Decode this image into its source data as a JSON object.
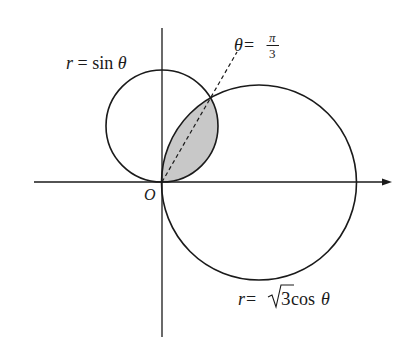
{
  "figure": {
    "colors": {
      "stroke": "#1a1a1a",
      "shade": "#c8c8c8",
      "background": "#ffffff"
    },
    "origin_label": "O",
    "curves": [
      {
        "id": "sin",
        "label_lhs": "r",
        "label_eq": " = ",
        "label_rhs_fn": "sin",
        "label_rhs_var": " θ"
      },
      {
        "id": "cos",
        "label_lhs": "r",
        "label_eq": " = ",
        "label_sqrt_radicand": "3",
        "label_rhs_fn": " cos",
        "label_rhs_var": " θ"
      }
    ],
    "ray": {
      "lhs": "θ",
      "eq": " = ",
      "numerator": "π",
      "denominator": "3"
    }
  }
}
